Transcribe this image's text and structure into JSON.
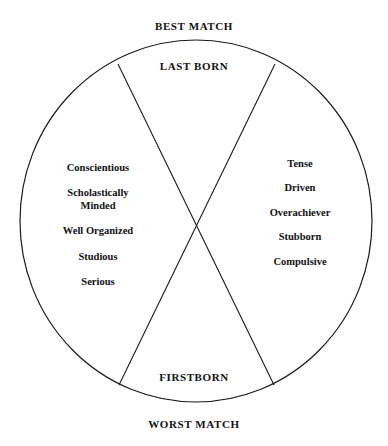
{
  "diagram": {
    "type": "birth-order-compatibility-circle",
    "top_caption": "BEST MATCH",
    "bottom_caption": "WORST MATCH",
    "segments": {
      "top": {
        "title": "LAST BORN"
      },
      "bottom": {
        "title": "FIRSTBORN"
      },
      "left": {
        "traits": [
          {
            "line1": "Conscientious",
            "line2": ""
          },
          {
            "line1": "Scholastically",
            "line2": "Minded"
          },
          {
            "line1": "Well Organized",
            "line2": ""
          },
          {
            "line1": "Studious",
            "line2": ""
          },
          {
            "line1": "Serious",
            "line2": ""
          }
        ]
      },
      "right": {
        "traits": [
          {
            "line1": "Tense",
            "line2": ""
          },
          {
            "line1": "Driven",
            "line2": ""
          },
          {
            "line1": "Overachiever",
            "line2": ""
          },
          {
            "line1": "Stubborn",
            "line2": ""
          },
          {
            "line1": "Compulsive",
            "line2": ""
          }
        ]
      }
    },
    "geometry": {
      "center_x": 196,
      "center_y": 221,
      "radius_x": 176,
      "radius_y": 181,
      "chord_a": {
        "x1": 118,
        "y1": 64,
        "x2": 274,
        "y2": 385
      },
      "chord_b": {
        "x1": 275,
        "y1": 64,
        "x2": 119,
        "y2": 385
      }
    },
    "colors": {
      "background": "#ffffff",
      "stroke": "#1a1a1a",
      "text": "#111111"
    }
  }
}
